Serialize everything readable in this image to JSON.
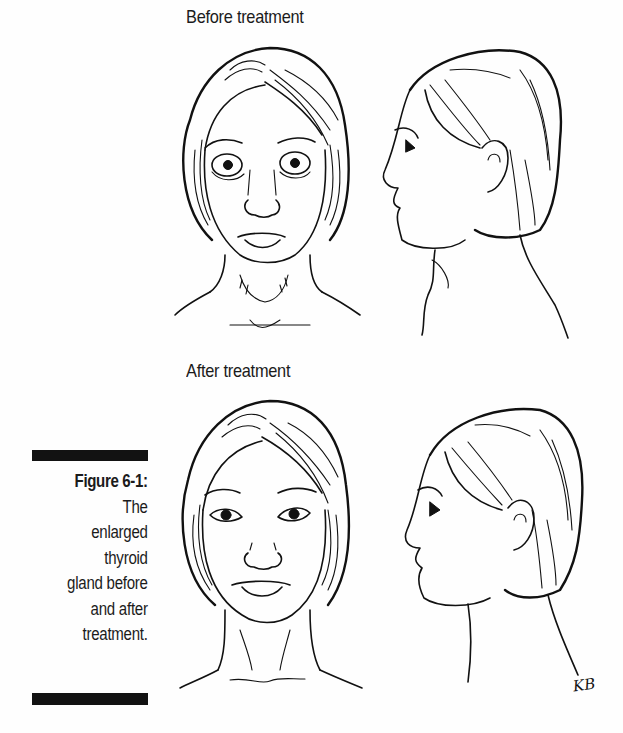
{
  "figure": {
    "panels": [
      {
        "label": "Before treatment",
        "views": [
          "front-view",
          "profile-view"
        ],
        "state": "enlarged thyroid (goiter) visible at neck"
      },
      {
        "label": "After treatment",
        "views": [
          "front-view",
          "profile-view"
        ],
        "state": "normal neck contour"
      }
    ],
    "caption": {
      "figure_number": "Figure 6-1:",
      "lines": [
        "The",
        "enlarged",
        "thyroid",
        "gland before",
        "and after",
        "treatment."
      ]
    },
    "artist_signature": "KB"
  }
}
